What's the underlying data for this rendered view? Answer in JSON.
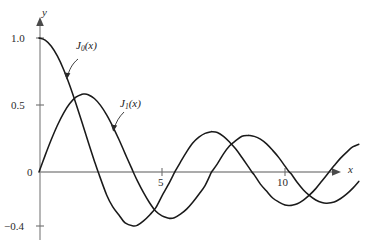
{
  "chart_data": {
    "type": "line",
    "title": "",
    "subtitle": "",
    "xlabel": "x",
    "ylabel": "y",
    "xlim": [
      0,
      13
    ],
    "ylim": [
      -0.5,
      1.1
    ],
    "grid": false,
    "legend_position": "inline-annotations",
    "xticks": [
      5,
      10
    ],
    "xtick_labels": [
      "5",
      "10"
    ],
    "yticks": [
      1.0,
      0.5,
      0,
      -0.4
    ],
    "ytick_labels": [
      "1.0",
      "0.5",
      "0",
      "−0.4"
    ],
    "annotations": [
      {
        "text": "J0(x)",
        "display": "J",
        "sub": "0",
        "tail": "(x)",
        "target_x": 1.2,
        "target_y": 0.78
      },
      {
        "text": "J1(x)",
        "display": "J",
        "sub": "1",
        "tail": "(x)",
        "target_x": 3.35,
        "target_y": 0.35
      }
    ],
    "series": [
      {
        "name": "J0(x)",
        "color": "#1a1a1a",
        "x": [
          0,
          0.25,
          0.5,
          0.75,
          1,
          1.25,
          1.5,
          1.75,
          2,
          2.25,
          2.4048,
          2.75,
          3,
          3.25,
          3.5,
          3.8317,
          4,
          4.25,
          4.5,
          4.75,
          5,
          5.25,
          5.5,
          5.5201,
          5.75,
          6,
          6.25,
          6.5,
          6.75,
          7,
          7.0156,
          7.25,
          7.5,
          7.75,
          8,
          8.25,
          8.5,
          8.6537,
          8.75,
          9,
          9.25,
          9.5,
          9.75,
          10,
          10.1735,
          10.25,
          10.5,
          10.75,
          11,
          11.25,
          11.5,
          11.7915,
          12,
          12.25,
          12.5,
          12.75,
          13
        ],
        "y": [
          1.0,
          0.9844,
          0.9385,
          0.8642,
          0.7652,
          0.6459,
          0.5118,
          0.369,
          0.2239,
          0.0827,
          0.0,
          -0.1712,
          -0.2601,
          -0.3202,
          -0.3801,
          -0.4028,
          -0.3971,
          -0.3643,
          -0.3205,
          -0.2655,
          -0.1776,
          -0.0968,
          -0.0068,
          0.0,
          0.0738,
          0.1506,
          0.2159,
          0.2601,
          0.2882,
          0.3001,
          0.3001,
          0.2951,
          0.2663,
          0.2225,
          0.1717,
          0.1083,
          0.0419,
          0.0,
          -0.0211,
          -0.0903,
          -0.1424,
          -0.1939,
          -0.2243,
          -0.2459,
          -0.2497,
          -0.249,
          -0.2366,
          -0.2097,
          -0.1712,
          -0.124,
          -0.0677,
          0.0,
          0.0477,
          0.1018,
          0.1469,
          0.1868,
          0.2069
        ],
        "max_labeled": 1.0,
        "first_zero": 2.4048,
        "first_min": -0.4028,
        "second_max": 0.3001
      },
      {
        "name": "J1(x)",
        "color": "#1a1a1a",
        "x": [
          0,
          0.25,
          0.5,
          0.75,
          1,
          1.25,
          1.5,
          1.75,
          1.8412,
          2,
          2.25,
          2.5,
          2.75,
          3,
          3.25,
          3.5,
          3.75,
          3.8317,
          4,
          4.25,
          4.5,
          4.75,
          5,
          5.25,
          5.3314,
          5.5,
          5.75,
          6,
          6.25,
          6.5,
          6.75,
          7,
          7.0156,
          7.25,
          7.5,
          7.75,
          8,
          8.25,
          8.5,
          8.5363,
          8.75,
          9,
          9.25,
          9.5,
          9.75,
          10,
          10.1735,
          10.25,
          10.5,
          10.75,
          11,
          11.25,
          11.5,
          11.706,
          12,
          12.25,
          12.5,
          12.75,
          13
        ],
        "y": [
          0,
          0.124,
          0.2423,
          0.3492,
          0.4401,
          0.5106,
          0.5579,
          0.5802,
          0.5819,
          0.5767,
          0.5484,
          0.4971,
          0.426,
          0.3391,
          0.2423,
          0.1374,
          0.0342,
          0.0,
          -0.066,
          -0.1538,
          -0.2311,
          -0.2935,
          -0.3276,
          -0.3432,
          -0.3461,
          -0.3414,
          -0.3147,
          -0.2767,
          -0.2252,
          -0.1655,
          -0.1012,
          -0.0047,
          0.0,
          0.0602,
          0.1352,
          0.1952,
          0.2346,
          0.2668,
          0.2731,
          0.2731,
          0.2658,
          0.2453,
          0.2096,
          0.1613,
          0.1073,
          0.0435,
          0.0,
          -0.0137,
          -0.0789,
          -0.1339,
          -0.1768,
          -0.2092,
          -0.2284,
          -0.2325,
          -0.2234,
          -0.1998,
          -0.1655,
          -0.1223,
          -0.0703
        ],
        "first_max": 0.5819,
        "first_zero": 3.8317,
        "first_min": -0.3461,
        "second_max": 0.2731
      }
    ]
  },
  "axes": {
    "y_name": "y",
    "x_name": "x",
    "y_tick_labels": [
      "1.0",
      "0.5",
      "0",
      "−0.4"
    ],
    "x_tick_labels": [
      "5",
      "10"
    ],
    "axis_color": "#8f8f8f",
    "curve_color": "#1a1a1a",
    "background": "#ffffff"
  },
  "labels": {
    "j0": {
      "base": "J",
      "sub": "0",
      "arg": "(x)"
    },
    "j1": {
      "base": "J",
      "sub": "1",
      "arg": "(x)"
    }
  }
}
